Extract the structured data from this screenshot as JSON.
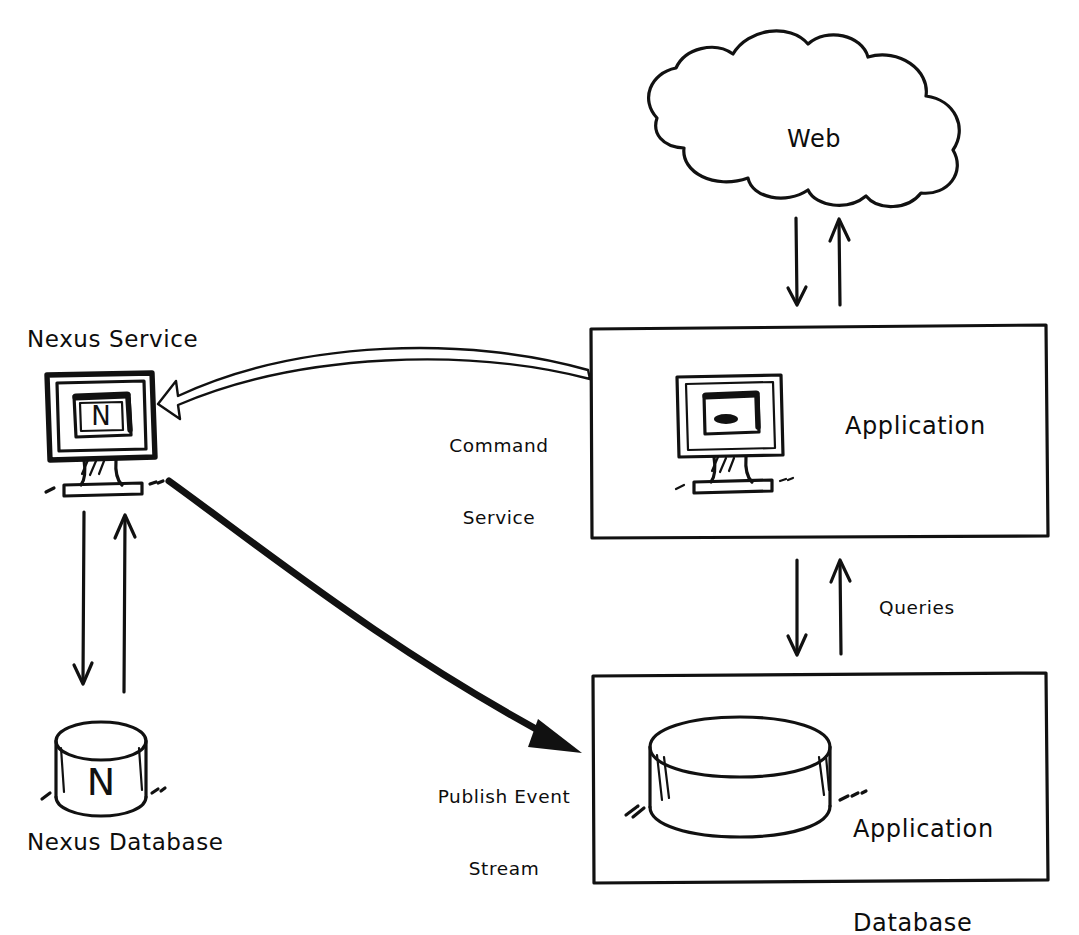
{
  "diagram": {
    "style": "hand-drawn sketch",
    "background_color": "#ffffff",
    "ink_color": "#111111",
    "nodes": [
      {
        "id": "nexus-service",
        "label": "Nexus Service",
        "icon": "monitor-icon",
        "icon_screen_letter": "N",
        "label_position": "above"
      },
      {
        "id": "nexus-database",
        "label": "Nexus Database",
        "icon": "database-cylinder-icon",
        "icon_letter": "N",
        "label_position": "below"
      },
      {
        "id": "web",
        "label": "Web",
        "icon": "cloud-icon",
        "label_position": "inside"
      },
      {
        "id": "application",
        "label": "Application",
        "icon": "monitor-icon",
        "container": "rectangle",
        "label_position": "inside-right"
      },
      {
        "id": "application-database",
        "label": "Application\nDatabase",
        "label_line1": "Application",
        "label_line2": "Database",
        "icon": "database-cylinder-icon",
        "container": "rectangle",
        "label_position": "inside-right"
      }
    ],
    "edges": [
      {
        "id": "command-service",
        "label_line1": "Command",
        "label_line2": "Service",
        "from": "application",
        "to": "nexus-service",
        "arrow_style": "hollow-outline-curved",
        "direction": "right-to-left"
      },
      {
        "id": "publish-event-stream",
        "label_line1": "Publish Event",
        "label_line2": "Stream",
        "from": "nexus-service",
        "to": "application-database",
        "arrow_style": "thick-solid-curved",
        "direction": "left-to-right"
      },
      {
        "id": "queries",
        "label": "Queries",
        "from": "application",
        "to": "application-database",
        "arrow_style": "bidirectional-vertical-pair",
        "direction": "both"
      },
      {
        "id": "web-application",
        "label": "",
        "from": "web",
        "to": "application",
        "arrow_style": "bidirectional-vertical-pair",
        "direction": "both"
      },
      {
        "id": "nexus-service-database",
        "label": "",
        "from": "nexus-service",
        "to": "nexus-database",
        "arrow_style": "bidirectional-vertical-pair",
        "direction": "both"
      }
    ]
  }
}
